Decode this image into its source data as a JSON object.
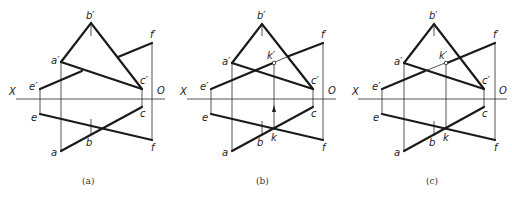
{
  "figure": {
    "axis": {
      "x_label": "X",
      "o_label": "O"
    },
    "panels": [
      {
        "id": "a",
        "caption": "(a)",
        "offset_x": 0,
        "labels": {
          "b_p": "b′",
          "a_p": "a′",
          "c_p": "c′",
          "e_p": "e′",
          "f_p": "f′",
          "e": "e",
          "c": "c",
          "a": "a",
          "b": "b",
          "f": "f"
        }
      },
      {
        "id": "b",
        "caption": "(b)",
        "offset_x": 171,
        "labels": {
          "b_p": "b′",
          "a_p": "a′",
          "c_p": "c′",
          "e_p": "e′",
          "f_p": "f′",
          "k_p": "k′",
          "e": "e",
          "c": "c",
          "a": "a",
          "b": "b",
          "f": "f",
          "k": "k"
        }
      },
      {
        "id": "c",
        "caption": "(c)",
        "offset_x": 342,
        "labels": {
          "b_p": "b′",
          "a_p": "a′",
          "c_p": "c′",
          "e_p": "e′",
          "f_p": "f′",
          "k_p": "k′",
          "e": "e",
          "c": "c",
          "a": "a",
          "b": "b",
          "f": "f",
          "k": "k"
        }
      }
    ]
  }
}
